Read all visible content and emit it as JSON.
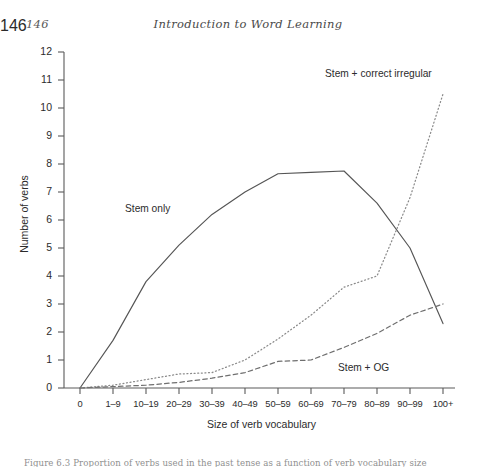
{
  "page": {
    "number": "146",
    "running_head": "Introduction to Word Learning",
    "caption_fragment": "Figure 6.3 Proportion of verbs used in the past tense as a function of verb vocabulary size"
  },
  "chart_data": {
    "type": "line",
    "title": "",
    "xlabel": "Size of verb vocabulary",
    "ylabel": "Number of verbs",
    "categories": [
      "0",
      "1–9",
      "10–19",
      "20–29",
      "30–39",
      "40–49",
      "50–59",
      "60–69",
      "70–79",
      "80–89",
      "90–99",
      "100+"
    ],
    "ylim": [
      0,
      12
    ],
    "yticks": [
      "0",
      "1",
      "2",
      "3",
      "4",
      "5",
      "6",
      "7",
      "8",
      "9",
      "10",
      "11",
      "12"
    ],
    "grid": false,
    "legend_position": "inline-annotations",
    "series": [
      {
        "name": "Stem only",
        "style": "solid",
        "color": "#555555",
        "values": [
          0.0,
          1.7,
          3.8,
          5.1,
          6.2,
          7.0,
          7.65,
          7.7,
          7.75,
          6.6,
          5.0,
          2.3
        ]
      },
      {
        "name": "Stem + correct irregular",
        "style": "dotted",
        "color": "#8a8a8a",
        "values": [
          0.0,
          0.1,
          0.3,
          0.5,
          0.55,
          1.0,
          1.75,
          2.6,
          3.6,
          4.0,
          6.8,
          10.5
        ]
      },
      {
        "name": "Stem + OG",
        "style": "dashed",
        "color": "#6f6f6f",
        "values": [
          0.0,
          0.05,
          0.1,
          0.2,
          0.35,
          0.55,
          0.95,
          1.0,
          1.45,
          1.95,
          2.6,
          3.0
        ]
      }
    ],
    "annotations": [
      {
        "text": "Stem only",
        "series": "Stem only"
      },
      {
        "text": "Stem + correct irregular",
        "series": "Stem + correct irregular"
      },
      {
        "text": "Stem + OG",
        "series": "Stem + OG"
      }
    ]
  }
}
